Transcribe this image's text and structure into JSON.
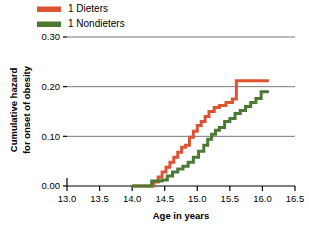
{
  "chart_data": {
    "type": "line",
    "title": "",
    "subtitle": "",
    "xlabel": "Age in years",
    "ylabel": "Cumulative hazard for onset of obesity",
    "ylabel_line1": "Cumulative hazard",
    "ylabel_line2": "for onset of obesity",
    "xlim": [
      13.0,
      16.5
    ],
    "ylim": [
      0.0,
      0.3
    ],
    "xticks": [
      "13.0",
      "13.5",
      "14.0",
      "14.5",
      "15.0",
      "15.5",
      "16.0",
      "16.5"
    ],
    "xtick_values": [
      13.0,
      13.5,
      14.0,
      14.5,
      15.0,
      15.5,
      16.0,
      16.5
    ],
    "yticks": [
      "0.00",
      "0.10",
      "0.20",
      "0.30"
    ],
    "ytick_values": [
      0.0,
      0.1,
      0.2,
      0.3
    ],
    "grid": "horizontal",
    "legend_position": "top-left",
    "step_style": "post",
    "series": [
      {
        "name": "1 Dieters",
        "color": "#DD5432",
        "x": [
          14.0,
          14.28,
          14.33,
          14.4,
          14.46,
          14.52,
          14.58,
          14.64,
          14.7,
          14.76,
          14.82,
          14.88,
          14.94,
          15.0,
          15.06,
          15.12,
          15.18,
          15.26,
          15.34,
          15.44,
          15.54,
          15.6,
          16.1
        ],
        "y": [
          0.0,
          0.0,
          0.008,
          0.018,
          0.028,
          0.038,
          0.048,
          0.058,
          0.068,
          0.078,
          0.082,
          0.098,
          0.11,
          0.122,
          0.13,
          0.14,
          0.15,
          0.158,
          0.162,
          0.168,
          0.175,
          0.212,
          0.212
        ]
      },
      {
        "name": "1 Nondieters",
        "color": "#4C7A33",
        "x": [
          14.0,
          14.22,
          14.3,
          14.38,
          14.46,
          14.54,
          14.62,
          14.7,
          14.78,
          14.86,
          14.94,
          15.02,
          15.1,
          15.16,
          15.22,
          15.28,
          15.34,
          15.42,
          15.5,
          15.58,
          15.66,
          15.74,
          15.82,
          15.9,
          15.98,
          16.1
        ],
        "y": [
          0.0,
          0.0,
          0.01,
          0.01,
          0.012,
          0.02,
          0.028,
          0.034,
          0.04,
          0.048,
          0.058,
          0.07,
          0.082,
          0.094,
          0.104,
          0.112,
          0.118,
          0.13,
          0.136,
          0.146,
          0.152,
          0.16,
          0.168,
          0.176,
          0.19,
          0.19
        ]
      }
    ]
  },
  "legend": {
    "items": [
      {
        "label": "1 Dieters",
        "color": "#DD5432"
      },
      {
        "label": "1 Nondieters",
        "color": "#4C7A33"
      }
    ]
  }
}
